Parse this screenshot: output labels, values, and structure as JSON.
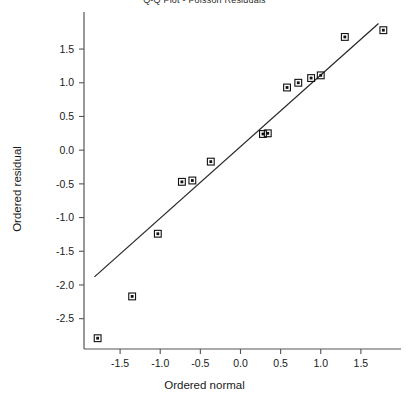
{
  "chart_data": {
    "type": "scatter",
    "title": "Q-Q Plot - Poisson Residuals",
    "xlabel": "Ordered normal",
    "ylabel": "Ordered residual",
    "xlim": [
      -1.95,
      2.0
    ],
    "ylim": [
      -2.95,
      2.05
    ],
    "grid": false,
    "legend": null,
    "xticks": [
      -1.5,
      -1.0,
      -0.5,
      0.0,
      0.5,
      1.0,
      1.5
    ],
    "xtick_labels": [
      "-1.5",
      "-1.0",
      "-0.5",
      "0.0",
      "0.5",
      "1.0",
      "1.5"
    ],
    "yticks": [
      1.5,
      1.0,
      0.5,
      0.0,
      -0.5,
      -1.0,
      -1.5,
      -2.0,
      -2.5
    ],
    "ytick_labels": [
      "1.5",
      "1.0",
      "0.5",
      "0.0",
      "-0.5",
      "-1.0",
      "-1.5",
      "-2.0",
      "-2.5"
    ],
    "marker": "square-dot",
    "marker_color": "#111111",
    "line_color": "#2a2a2a",
    "points": [
      {
        "x": -1.78,
        "y": -2.79
      },
      {
        "x": -1.35,
        "y": -2.17
      },
      {
        "x": -1.03,
        "y": -1.24
      },
      {
        "x": -0.73,
        "y": -0.47
      },
      {
        "x": -0.6,
        "y": -0.45
      },
      {
        "x": -0.37,
        "y": -0.17
      },
      {
        "x": 0.28,
        "y": 0.24
      },
      {
        "x": 0.34,
        "y": 0.25
      },
      {
        "x": 0.58,
        "y": 0.93
      },
      {
        "x": 0.72,
        "y": 1.0
      },
      {
        "x": 0.88,
        "y": 1.07
      },
      {
        "x": 1.0,
        "y": 1.11
      },
      {
        "x": 1.3,
        "y": 1.68
      },
      {
        "x": 1.78,
        "y": 1.78
      }
    ],
    "reference_line": {
      "x0": -1.82,
      "y0": -1.88,
      "x1": 1.72,
      "y1": 1.88
    }
  }
}
